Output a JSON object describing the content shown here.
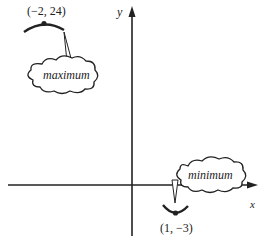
{
  "axes": {
    "x_label": "x",
    "y_label": "y"
  },
  "maximum": {
    "point_label": "(−2, 24)",
    "callout_text": "maximum",
    "x": -2,
    "y": 24
  },
  "minimum": {
    "point_label": "(1, −3)",
    "callout_text": "minimum",
    "x": 1,
    "y": -3
  },
  "colors": {
    "ink": "#222222",
    "background": "#ffffff"
  }
}
